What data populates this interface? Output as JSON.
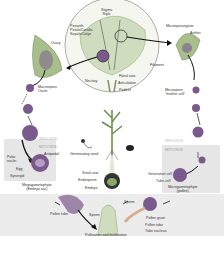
{
  "diagram": {
    "type": "plant-life-cycle",
    "flower": {
      "labels": {
        "stigma_style": "Stigma\nStyle",
        "perianth": "Perianth\nPetals/Corolla\nSepals/Calyx",
        "nectary": "Nectary",
        "floral_axis": "Floral axis",
        "articulation": "Articulation",
        "pedicel": "Pedicel",
        "filament": "Filament"
      }
    },
    "female_side": {
      "ovary": "Ovary",
      "megaspore": "Macrospore\nOvule",
      "meiosis": "MEIOSIS",
      "mitosis": "MITOSIS",
      "polar_nuclei": "Polar\nnuclei",
      "antipodal": "Antipodal",
      "egg": "Egg",
      "synergid": "Synergid",
      "megagametophyte": "Megagametophyte\n(Embryo sac)"
    },
    "male_side": {
      "microsporangium": "Microsporangium",
      "anther": "Anther",
      "microspore": "Microspore\n\"mother cell\"",
      "meiosis": "MEIOSIS",
      "mitosis": "MITOSIS",
      "generative_cell": "Generative cell",
      "tube_cell": "Tube cell",
      "microgametophyte": "Microgametophyte\n(pollen)"
    },
    "center": {
      "germinating_seed": "Germinating seed",
      "seed_coat": "Seed coat",
      "endosperm": "Endosperm",
      "embryo": "Embryo"
    },
    "bottom": {
      "pollen_tube_left": "Pollen tube",
      "sperm_left": "Sperm",
      "sperm_right": "Sperm",
      "pollen_grain": "Pollen grain",
      "pollen_tube_right": "Pollen tube",
      "tube_nucleus": "Tube nucleus",
      "caption": "Pollination and fertilization"
    },
    "colors": {
      "purple": "#7a5a8c",
      "green": "#8aa868",
      "panel": "#e6e6e6",
      "arrow": "#111111"
    }
  }
}
